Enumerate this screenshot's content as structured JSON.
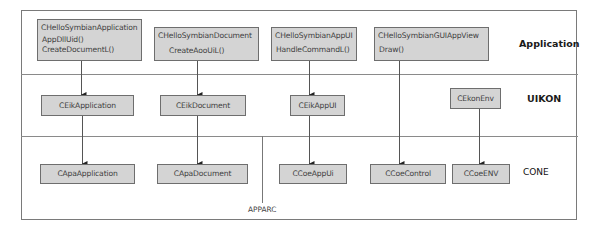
{
  "diagram": {
    "layers": [
      {
        "name": "Application"
      },
      {
        "name": "UIKON"
      },
      {
        "name": "CONE"
      }
    ],
    "apparc_label": "APPARC",
    "application_layer": {
      "boxes": [
        {
          "title": "CHelloSymbianApplication",
          "methods": [
            "AppDllUid()",
            "CreateDocumentL()"
          ]
        },
        {
          "title": "CHelloSymbianDocument",
          "methods": [
            "CreateAooUiL()"
          ]
        },
        {
          "title": "CHelloSymbianAppUI",
          "methods": [
            "HandleCommandL()"
          ]
        },
        {
          "title": "CHelloSymbianGUIAppView",
          "methods": [
            "Draw()"
          ]
        }
      ]
    },
    "uikon_layer": {
      "boxes": [
        {
          "title": "CEikApplication"
        },
        {
          "title": "CEikDocument"
        },
        {
          "title": "CEikAppUI"
        },
        {
          "title": "CEkonEnv"
        }
      ]
    },
    "cone_layer": {
      "boxes": [
        {
          "title": "CApaApplication"
        },
        {
          "title": "CApaDocument"
        },
        {
          "title": "CCoeAppUi"
        },
        {
          "title": "CCoeControl"
        },
        {
          "title": "CCoeENV"
        }
      ]
    },
    "connections": [
      {
        "from": "CHelloSymbianApplication",
        "to": "CEikApplication"
      },
      {
        "from": "CEikApplication",
        "to": "CApaApplication"
      },
      {
        "from": "CHelloSymbianDocument",
        "to": "CEikDocument"
      },
      {
        "from": "CEikDocument",
        "to": "CApaDocument"
      },
      {
        "from": "CHelloSymbianAppUI",
        "to": "CEikAppUI"
      },
      {
        "from": "CEikAppUI",
        "to": "CCoeAppUi"
      },
      {
        "from": "CHelloSymbianGUIAppView",
        "to": "CCoeControl"
      },
      {
        "from": "CEkonEnv",
        "to": "CCoeENV"
      }
    ],
    "colors": {
      "box_fill": "#d4d4d4",
      "box_border": "#6e6e6e",
      "line": "#555555"
    }
  }
}
